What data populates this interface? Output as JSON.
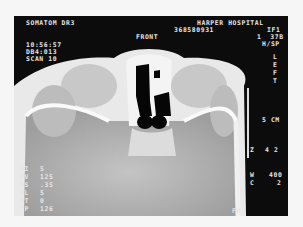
{
  "header": {
    "scanner": "SOMATOM DR3",
    "institution": "HARPER HOSPITAL",
    "patient_id": "368580931",
    "series": "IF1",
    "image_no": "1  37B",
    "orientation_code": "H/SP",
    "time": "10:56:57",
    "db": "DB4:013",
    "scan": "SCAN 10"
  },
  "labels": {
    "front": "FRONT",
    "side": [
      "L",
      "E",
      "F",
      "T"
    ],
    "scale": "5 CM",
    "z_label": "Z",
    "z_value": "4 2",
    "w_label": "W",
    "w_value": "400",
    "c_label": "C",
    "c_value": "2",
    "bottom_marker": "FH"
  },
  "params": [
    {
      "key": "TI",
      "value": "5"
    },
    {
      "key": "KV",
      "value": "125"
    },
    {
      "key": "AS",
      "value": ".35"
    },
    {
      "key": "SL",
      "value": "5"
    },
    {
      "key": "GT",
      "value": "0"
    },
    {
      "key": "TP",
      "value": "126"
    }
  ],
  "colors": {
    "frame": "#0c0c0c",
    "bone": "#f2f2f2",
    "brain": "#b5b5b5",
    "air": "#050505",
    "text": "#e6e6e6"
  }
}
